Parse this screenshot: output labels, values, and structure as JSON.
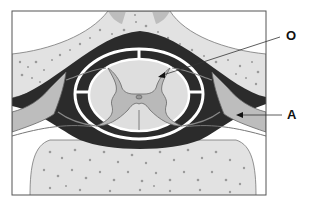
{
  "diagram": {
    "type": "anatomical-cross-section",
    "labels": [
      {
        "id": "O",
        "text": "O",
        "points_to": "dorsal horn of grey matter"
      },
      {
        "id": "A",
        "text": "A",
        "points_to": "dorsal root ganglion / spinal nerve"
      }
    ]
  },
  "colors": {
    "frame": "#555555",
    "bone": "#e2e2e2",
    "bone_pores": "#9a9a9a",
    "dark_space": "#2b2b2b",
    "meninges_white": "#ffffff",
    "white_matter": "#dedede",
    "grey_matter": "#b9b9b9",
    "nerve": "#bdbdbd",
    "outline": "#666666"
  }
}
